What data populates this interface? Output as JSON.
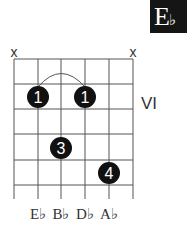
{
  "chord": {
    "name": "E♭",
    "root": "E",
    "accidental": "♭",
    "position_label": "VI"
  },
  "muted_strings": [
    {
      "label": "x",
      "string": 6
    },
    {
      "label": "x",
      "string": 1
    }
  ],
  "fingers": [
    {
      "finger": "1",
      "string": 5,
      "fret": 1
    },
    {
      "finger": "1",
      "string": 3,
      "fret": 1
    },
    {
      "finger": "3",
      "string": 4,
      "fret": 3
    },
    {
      "finger": "4",
      "string": 2,
      "fret": 4
    }
  ],
  "barre": {
    "from_string": 5,
    "to_string": 3,
    "fret": 1
  },
  "notes": [
    "E♭",
    "B♭",
    "D♭",
    "A♭"
  ],
  "colors": {
    "grid": "#555555",
    "dot": "#111111",
    "dot_text": "#ffffff",
    "badge_bg": "#151515"
  }
}
